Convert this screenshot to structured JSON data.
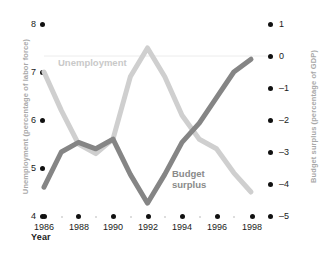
{
  "chart_data": {
    "type": "line",
    "title": "",
    "xlabel": "Year",
    "x": [
      1986,
      1987,
      1988,
      1989,
      1990,
      1991,
      1992,
      1993,
      1994,
      1995,
      1996,
      1997,
      1998
    ],
    "xticks": [
      "1986",
      "1988",
      "1990",
      "1992",
      "1994",
      "1996",
      "1998"
    ],
    "grid": true,
    "gridlines": [
      0
    ],
    "legend_position": "inline-annotation",
    "series": [
      {
        "name": "Unemployment",
        "axis": "left",
        "color": "#cfcfcf",
        "ylabel": "Unemployment (percentage of labor force)",
        "ylim": [
          4,
          8
        ],
        "yticks": [
          "8",
          "7",
          "6",
          "5",
          "4"
        ],
        "values": [
          7.0,
          6.2,
          5.5,
          5.3,
          5.6,
          6.9,
          7.5,
          6.9,
          6.1,
          5.6,
          5.4,
          4.9,
          4.5
        ]
      },
      {
        "name": "Budget surplus",
        "axis": "right",
        "color": "#858585",
        "ylabel": "Budget surplus (percentage of GDP)",
        "ylim": [
          -5,
          1
        ],
        "yticks": [
          "1",
          "0",
          "-1",
          "-2",
          "-3",
          "-4",
          "-5"
        ],
        "values": [
          -4.1,
          -3.0,
          -2.7,
          -2.9,
          -2.6,
          -3.7,
          -4.6,
          -3.7,
          -2.7,
          -2.1,
          -1.3,
          -0.5,
          -0.1
        ]
      }
    ]
  },
  "labels": {
    "y_left_title": "Unemployment (percentage of labor force)",
    "y_right_title": "Budget surplus (percentage of GDP)",
    "x_title": "Year",
    "series_unemployment": "Unemployment",
    "series_budget_line1": "Budget",
    "series_budget_line2": "surplus"
  },
  "ticks": {
    "left": [
      "8",
      "7",
      "6",
      "5",
      "4"
    ],
    "right": [
      "1",
      "0",
      "–1",
      "–2",
      "–3",
      "–4",
      "–5"
    ],
    "bottom": [
      "1986",
      "1988",
      "1990",
      "1992",
      "1994",
      "1996",
      "1998"
    ]
  },
  "colors": {
    "unemployment_line": "#cfcfcf",
    "budget_line": "#858585",
    "axis_title": "#a8a8a8",
    "tick_text": "#1a1a1a",
    "dot": "#111111",
    "gridline": "#ececec"
  }
}
